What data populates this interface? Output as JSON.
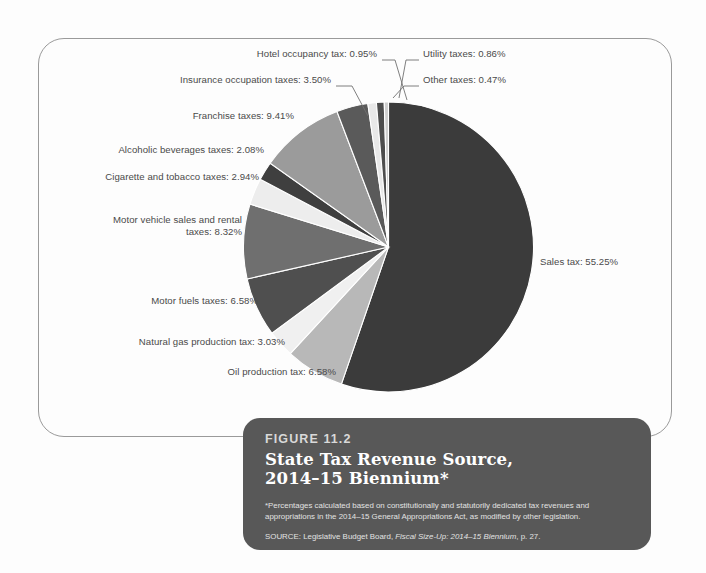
{
  "chart_data": {
    "type": "pie",
    "title": "State Tax Revenue Source, 2014–15 Biennium*",
    "unit": "percent",
    "legend_position": "callout-labels",
    "grid": false,
    "start_angle_deg": -90,
    "direction": "clockwise",
    "categories": [
      "Sales tax",
      "Oil production tax",
      "Natural gas production tax",
      "Motor fuels taxes",
      "Motor vehicle sales and rental taxes",
      "Cigarette and tobacco taxes",
      "Alcoholic beverages taxes",
      "Franchise taxes",
      "Insurance occupation taxes",
      "Hotel occupancy tax",
      "Utility taxes",
      "Other taxes"
    ],
    "values": [
      55.25,
      6.58,
      3.03,
      6.58,
      8.32,
      2.94,
      2.08,
      9.41,
      3.5,
      0.95,
      0.86,
      0.47
    ],
    "colors": [
      "#3b3b3b",
      "#b8b8b8",
      "#f0f0f0",
      "#4f4f4f",
      "#6f6f6f",
      "#ededed",
      "#3f3f3f",
      "#9b9b9b",
      "#5a5a5a",
      "#e8e8e8",
      "#4d4d4d",
      "#cfcfcf"
    ],
    "slices": [
      {
        "label": "Sales tax",
        "value": 55.25,
        "display": "Sales tax: 55.25%",
        "color": "#3b3b3b"
      },
      {
        "label": "Oil production tax",
        "value": 6.58,
        "display": "Oil production tax: 6.58%",
        "color": "#b8b8b8"
      },
      {
        "label": "Natural gas production tax",
        "value": 3.03,
        "display": "Natural gas production tax: 3.03%",
        "color": "#f0f0f0"
      },
      {
        "label": "Motor fuels taxes",
        "value": 6.58,
        "display": "Motor fuels taxes: 6.58%",
        "color": "#4f4f4f"
      },
      {
        "label": "Motor vehicle sales and rental taxes",
        "value": 8.32,
        "display": "Motor vehicle sales and rental\ntaxes: 8.32%",
        "color": "#6f6f6f"
      },
      {
        "label": "Cigarette and tobacco taxes",
        "value": 2.94,
        "display": "Cigarette and tobacco taxes: 2.94%",
        "color": "#ededed"
      },
      {
        "label": "Alcoholic beverages taxes",
        "value": 2.08,
        "display": "Alcoholic beverages taxes: 2.08%",
        "color": "#3f3f3f"
      },
      {
        "label": "Franchise taxes",
        "value": 9.41,
        "display": "Franchise taxes: 9.41%",
        "color": "#9b9b9b"
      },
      {
        "label": "Insurance occupation taxes",
        "value": 3.5,
        "display": "Insurance occupation taxes: 3.50%",
        "color": "#5a5a5a"
      },
      {
        "label": "Hotel occupancy tax",
        "value": 0.95,
        "display": "Hotel occupancy tax: 0.95%",
        "color": "#e8e8e8"
      },
      {
        "label": "Utility taxes",
        "value": 0.86,
        "display": "Utility taxes: 0.86%",
        "color": "#4d4d4d"
      },
      {
        "label": "Other taxes",
        "value": 0.47,
        "display": "Other taxes: 0.47%",
        "color": "#cfcfcf"
      }
    ]
  },
  "caption": {
    "figure_number": "FIGURE 11.2",
    "title_line1": "State Tax Revenue Source,",
    "title_line2": "2014–15 Biennium*",
    "footnote": "*Percentages calculated based on constitutionally and statutorily dedicated tax revenues and appropriations in the 2014–15 General Appropriations Act, as modified by other legislation.",
    "source_prefix": "SOURCE: Legislative Budget Board, ",
    "source_italic": "Fiscal Size-Up: 2014–15 Biennium",
    "source_suffix": ", p. 27."
  },
  "theme": {
    "page_background": "#fdfdfd",
    "frame_border": "#9a9a9a",
    "caption_background": "#585858",
    "caption_text": "#ffffff",
    "label_text": "#4a4a4a",
    "leader_line": "#707070"
  }
}
